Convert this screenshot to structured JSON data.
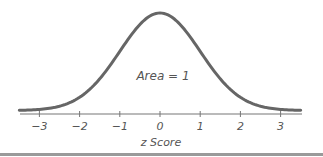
{
  "chart_data": {
    "type": "line",
    "title": "",
    "xlabel": "z Score",
    "ylabel": "",
    "xlim": [
      -3.5,
      3.5
    ],
    "ylim": [
      0,
      0.4
    ],
    "grid": false,
    "legend": null,
    "x_ticks": [
      -3,
      -2,
      -1,
      0,
      1,
      2,
      3
    ],
    "x_tick_labels": [
      "−3",
      "−2",
      "−1",
      "0",
      "1",
      "2",
      "3"
    ],
    "annotation": "Area = 1",
    "series": [
      {
        "name": "Standard normal distribution",
        "function": "pdf(z) = exp(-z^2/2)/sqrt(2*pi)",
        "x": [
          -3.5,
          -3,
          -2.5,
          -2,
          -1.5,
          -1,
          -0.5,
          0,
          0.5,
          1,
          1.5,
          2,
          2.5,
          3,
          3.5
        ],
        "values": [
          0.0009,
          0.0044,
          0.0175,
          0.054,
          0.1295,
          0.242,
          0.3521,
          0.3989,
          0.3521,
          0.242,
          0.1295,
          0.054,
          0.0175,
          0.0044,
          0.0009
        ]
      }
    ]
  },
  "colors": {
    "curve": "#666666",
    "axis": "#777777",
    "text": "#555555",
    "bottom_rule": "#9a9a9a"
  }
}
